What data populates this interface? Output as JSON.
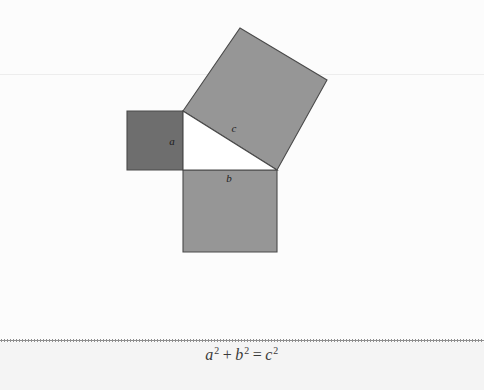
{
  "figure": {
    "name": "pythagorean-theorem-diagram",
    "background_color": "#fcfcfc",
    "bottom_band_color": "#f4f4f4",
    "separator_color": "#8e8e8e",
    "faint_rule_color": "#ededed",
    "outline_color": "#4a4a4a",
    "squares": [
      {
        "id": "a",
        "label": "a",
        "fill": "#6e6e6e",
        "label_x": 172,
        "label_y": 145,
        "points": "127,111 183,111 183,170 127,170"
      },
      {
        "id": "b",
        "label": "b",
        "fill": "#969696",
        "label_x": 229,
        "label_y": 182,
        "points": "183,170 277,170 277,252 183,252"
      },
      {
        "id": "c",
        "label": "c",
        "fill": "#969696",
        "label_x": 234,
        "label_y": 132,
        "points": "183,111 240,28 327,80 277,170"
      }
    ],
    "triangle": {
      "id": "right-triangle",
      "fill": "#ffffff",
      "points": "183,111 277,170 183,170"
    }
  },
  "equation": {
    "full_text": "a² + b² = c²",
    "a_base": "a",
    "a_exp": "2",
    "plus": "+",
    "b_base": "b",
    "b_exp": "2",
    "equals": "=",
    "c_base": "c",
    "c_exp": "2"
  }
}
